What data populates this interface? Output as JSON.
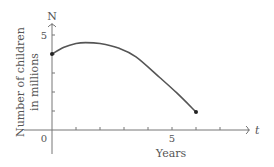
{
  "chart_data": {
    "type": "line",
    "title": "",
    "xlabel": "Years",
    "ylabel": "Number of children in millions",
    "x_axis_symbol": "t",
    "y_axis_symbol": "N",
    "xlim": [
      -1,
      8
    ],
    "ylim": [
      -1,
      5.5
    ],
    "x_ticks": [
      1,
      2,
      3,
      4,
      5,
      6,
      7
    ],
    "x_tick_labels": [
      {
        "value": 0,
        "label": "0"
      },
      {
        "value": 5,
        "label": "5"
      }
    ],
    "y_ticks": [
      1,
      2,
      3,
      4,
      5
    ],
    "y_tick_labels": [
      {
        "value": 5,
        "label": "5"
      }
    ],
    "grid": false,
    "series": [
      {
        "name": "N(t)",
        "x": [
          0,
          0.5,
          1,
          1.4,
          2,
          2.8,
          3.5,
          4.5,
          5.2,
          6
        ],
        "y": [
          4.0,
          4.35,
          4.55,
          4.6,
          4.55,
          4.3,
          3.85,
          2.75,
          1.95,
          0.95
        ]
      }
    ],
    "endpoints": [
      {
        "x": 0,
        "y": 4.0
      },
      {
        "x": 6,
        "y": 0.95
      }
    ],
    "colors": {
      "curve": "#555555",
      "axis": "#777777",
      "text": "#555555"
    }
  }
}
